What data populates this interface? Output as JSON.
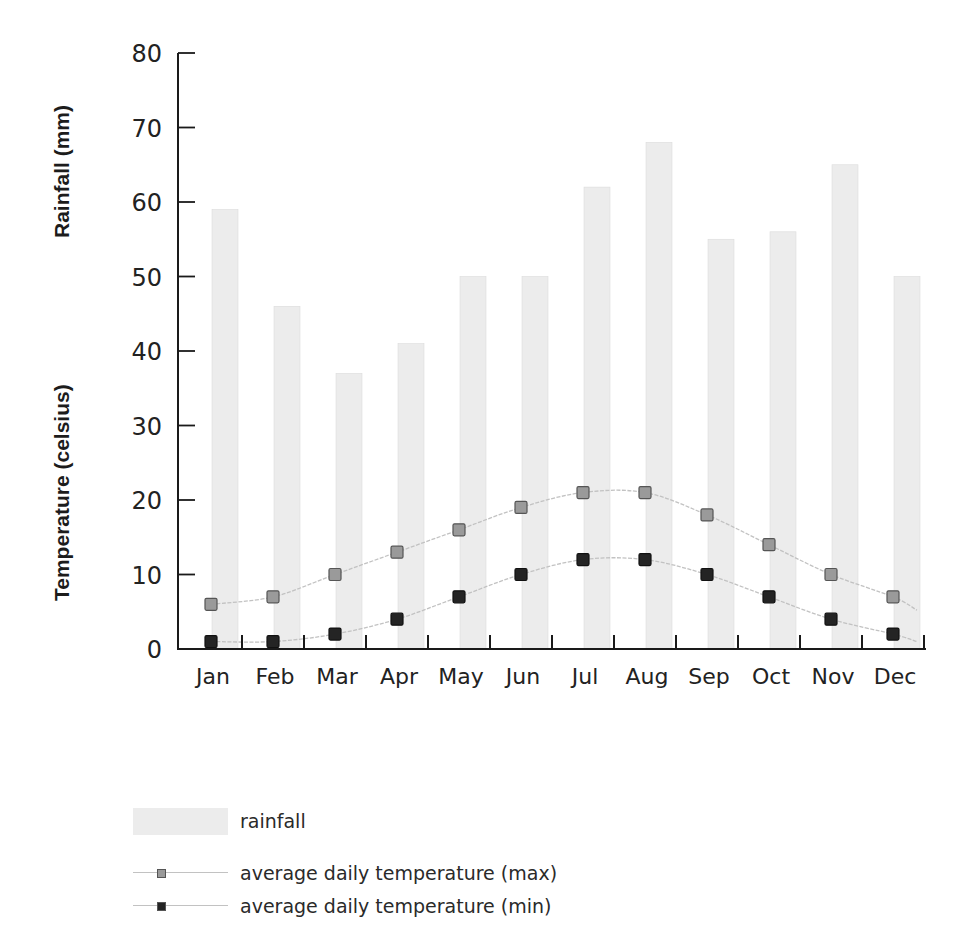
{
  "chart_data": {
    "type": "bar+line",
    "title": "",
    "categories": [
      "Jan",
      "Feb",
      "Mar",
      "Apr",
      "May",
      "Jun",
      "Jul",
      "Aug",
      "Sep",
      "Oct",
      "Nov",
      "Dec"
    ],
    "series": [
      {
        "name": "rainfall",
        "type": "bar",
        "values": [
          59,
          46,
          37,
          41,
          50,
          50,
          62,
          68,
          55,
          56,
          65,
          50
        ]
      },
      {
        "name": "average daily temperature (max)",
        "type": "line",
        "values": [
          6,
          7,
          10,
          13,
          16,
          19,
          21,
          21,
          18,
          14,
          10,
          7
        ]
      },
      {
        "name": "average daily temperature (min)",
        "type": "line",
        "values": [
          1,
          1,
          2,
          4,
          7,
          10,
          12,
          12,
          10,
          7,
          4,
          2
        ]
      }
    ],
    "xlabel": "",
    "ylabel": [
      "Rainfall (mm)",
      "Temperature (celsius)"
    ],
    "ylim": [
      0,
      80
    ],
    "yticks": [
      0,
      10,
      20,
      30,
      40,
      50,
      60,
      70,
      80
    ],
    "grid": false,
    "legend_position": "bottom-left"
  },
  "axis": {
    "ylabel_rainfall": "Rainfall (mm)",
    "ylabel_temperature": "Temperature (celsius)"
  },
  "legend": {
    "items": [
      {
        "label": "rainfall",
        "kind": "bar"
      },
      {
        "label": "average daily temperature (max)",
        "kind": "max"
      },
      {
        "label": "average daily temperature (min)",
        "kind": "min"
      }
    ]
  },
  "colors": {
    "bar": "#ececec",
    "bar_edge": "#dcdcdc",
    "max_marker": "#9a9a9a",
    "min_marker": "#242424",
    "line": "#c2c2c2",
    "axis": "#1a1a1a"
  }
}
